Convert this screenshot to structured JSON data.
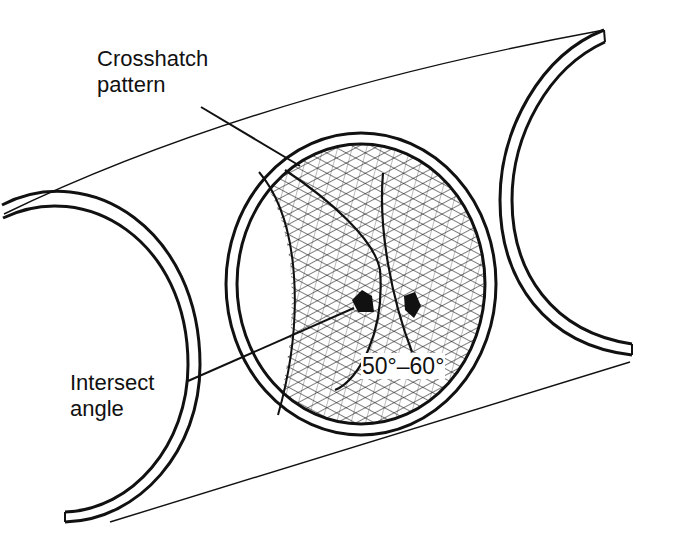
{
  "diagram": {
    "labels": {
      "crosshatch_line1": "Crosshatch",
      "crosshatch_line2": "pattern",
      "intersect_line1": "Intersect",
      "intersect_line2": "angle",
      "angle_range": "50°–60°"
    },
    "colors": {
      "ink": "#111111",
      "background": "#ffffff"
    },
    "parts": [
      "left-cylinder-arc",
      "right-cylinder-arc",
      "center-bore-ellipse",
      "crosshatch-hatching",
      "intersect-angle-arrows",
      "outline-top-line",
      "outline-bottom-line"
    ]
  }
}
